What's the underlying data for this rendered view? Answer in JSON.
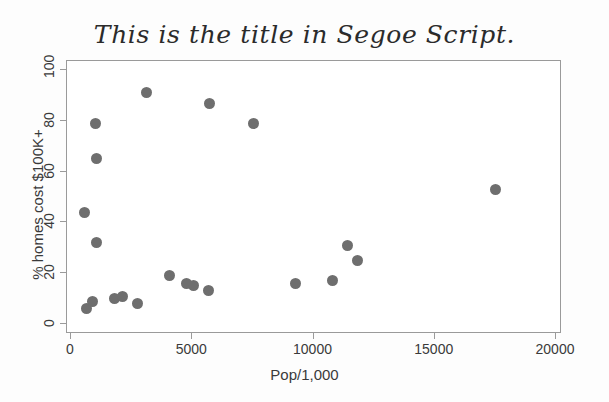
{
  "chart_data": {
    "type": "scatter",
    "title": "This is the title in Segoe Script.",
    "xlabel": "Pop/1,000",
    "ylabel": "% homes cost $100K+",
    "xlim": [
      0,
      20000
    ],
    "ylim": [
      0,
      100
    ],
    "xticks": [
      0,
      5000,
      10000,
      15000,
      20000
    ],
    "xtick_labels": [
      "0",
      "5000",
      "10000",
      "15000",
      "20000"
    ],
    "yticks": [
      0,
      20,
      40,
      60,
      80,
      100
    ],
    "ytick_labels": [
      "0",
      "20",
      "40",
      "60",
      "80",
      "100"
    ],
    "grid": false,
    "legend": null,
    "marker_color": "#6e6e6e",
    "marker_size_px": 11,
    "series": [
      {
        "name": "states",
        "points": [
          {
            "x": 560,
            "y": 44
          },
          {
            "x": 620,
            "y": 6
          },
          {
            "x": 880,
            "y": 9
          },
          {
            "x": 1020,
            "y": 79
          },
          {
            "x": 1060,
            "y": 65
          },
          {
            "x": 1070,
            "y": 32
          },
          {
            "x": 1800,
            "y": 10
          },
          {
            "x": 2130,
            "y": 11
          },
          {
            "x": 2760,
            "y": 8
          },
          {
            "x": 3120,
            "y": 91
          },
          {
            "x": 4050,
            "y": 19
          },
          {
            "x": 4780,
            "y": 16
          },
          {
            "x": 5070,
            "y": 15
          },
          {
            "x": 5650,
            "y": 13
          },
          {
            "x": 5720,
            "y": 87
          },
          {
            "x": 7520,
            "y": 79
          },
          {
            "x": 9250,
            "y": 16
          },
          {
            "x": 10780,
            "y": 17
          },
          {
            "x": 11420,
            "y": 31
          },
          {
            "x": 11830,
            "y": 25
          },
          {
            "x": 17500,
            "y": 53
          }
        ]
      }
    ]
  },
  "axis_title_colors": {
    "text": "#3a3a3a",
    "frame": "#9a9a9a"
  }
}
